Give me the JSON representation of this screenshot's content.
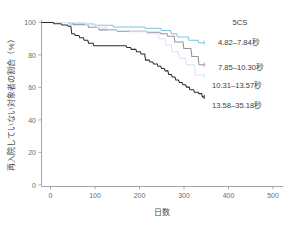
{
  "chart_data": {
    "type": "line",
    "title": "",
    "subtitle": "",
    "xlabel": "日数",
    "ylabel": "再入院していない対象者の割合（%）",
    "xlim": [
      -20,
      540
    ],
    "ylim": [
      0,
      104
    ],
    "xticks": [
      0,
      100,
      200,
      300,
      400,
      500
    ],
    "yticks": [
      0,
      20,
      40,
      60,
      80,
      100
    ],
    "xtick_labels": [
      "0",
      "100",
      "200",
      "300",
      "400",
      "500"
    ],
    "ytick_labels": [
      "0",
      "20",
      "40",
      "60",
      "80",
      "100"
    ],
    "grid": false,
    "legend_position": "right-inside",
    "legend_title": "5CS",
    "series": [
      {
        "name": "4.82-7.84秒",
        "label": "4.82–7.84秒",
        "color": "#7fc4e0",
        "x": [
          0,
          60,
          62,
          118,
          120,
          160,
          162,
          232,
          234,
          268,
          270,
          290,
          292,
          304,
          306,
          330,
          332,
          352,
          354,
          366
        ],
        "y": [
          100,
          100,
          99,
          99,
          98.2,
          98.2,
          97.2,
          97.2,
          96.4,
          96.4,
          95,
          95,
          93,
          93,
          91,
          91,
          89,
          89,
          87.5,
          87.5
        ],
        "final_value": 87.5
      },
      {
        "name": "7.85-10.30秒",
        "label": "7.85–10.30秒",
        "color": "#9a8fa0",
        "x": [
          0,
          70,
          72,
          104,
          106,
          128,
          130,
          168,
          170,
          236,
          238,
          266,
          268,
          282,
          284,
          298,
          300,
          318,
          320,
          336,
          338,
          352,
          354,
          366
        ],
        "y": [
          100,
          100,
          98.6,
          98.6,
          97,
          97,
          95.4,
          95.4,
          94.6,
          94.6,
          94,
          94,
          93,
          93,
          91.5,
          91.5,
          88,
          88,
          84,
          84,
          79,
          79,
          74,
          74
        ],
        "final_value": 74
      },
      {
        "name": "10.31-13.57秒",
        "label": "10.31–13.57秒",
        "color": "#d3e8f2",
        "x": [
          0,
          98,
          100,
          124,
          126,
          148,
          150,
          198,
          200,
          236,
          238,
          262,
          264,
          278,
          280,
          292,
          294,
          308,
          310,
          324,
          326,
          344,
          346,
          366
        ],
        "y": [
          100,
          100,
          98.6,
          98.6,
          96.8,
          96.8,
          95.2,
          95.2,
          94.2,
          94.2,
          93,
          93,
          90,
          90,
          86,
          86,
          82,
          82,
          78,
          78,
          74,
          74,
          67.5,
          67.5
        ],
        "final_value": 67.5
      },
      {
        "name": "13.58-35.18秒",
        "label": "13.58–35.18秒",
        "color": "#2b2b2b",
        "x": [
          0,
          26,
          28,
          44,
          46,
          58,
          60,
          66,
          68,
          74,
          76,
          84,
          86,
          94,
          96,
          104,
          106,
          116,
          118,
          190,
          192,
          200,
          202,
          212,
          214,
          222,
          224,
          232,
          234,
          242,
          244,
          250,
          252,
          260,
          262,
          268,
          270,
          276,
          278,
          284,
          286,
          292,
          294,
          300,
          302,
          308,
          310,
          316,
          318,
          324,
          326,
          332,
          334,
          342,
          344,
          352,
          354,
          360,
          362,
          366
        ],
        "y": [
          100,
          100,
          99.2,
          99.2,
          98.4,
          98.4,
          97.6,
          97.6,
          93,
          93,
          92,
          92,
          90.6,
          90.6,
          89,
          89,
          87.2,
          87.2,
          85.6,
          85.6,
          84.6,
          84.6,
          83.4,
          83.4,
          82,
          82,
          80.6,
          80.6,
          76.8,
          76.8,
          75.6,
          75.6,
          74.4,
          74.4,
          73,
          73,
          71.6,
          71.6,
          70.2,
          70.2,
          68,
          68,
          66.4,
          66.4,
          64.6,
          64.6,
          63,
          63,
          61.6,
          61.6,
          60.2,
          60.2,
          58.6,
          58.6,
          57,
          57,
          56.2,
          56.2,
          54.2,
          54.2
        ],
        "final_value": 54.2
      }
    ]
  },
  "legend": {
    "title": "5CS",
    "items": [
      {
        "label": "4.82–7.84秒",
        "color": "#7fc4e0"
      },
      {
        "label": "7.85–10.30秒",
        "color": "#9a8fa0"
      },
      {
        "label": "10.31–13.57秒",
        "color": "#d3e8f2"
      },
      {
        "label": "13.58–35.18秒",
        "color": "#2b2b2b"
      }
    ]
  },
  "axes": {
    "x_title": "日数",
    "y_title": "再入院していない対象者の割合（%）",
    "x_ticks": [
      "0",
      "100",
      "200",
      "300",
      "400",
      "500"
    ],
    "y_ticks": [
      "0",
      "20",
      "40",
      "60",
      "80",
      "100"
    ]
  },
  "colors": {
    "axis": "#9a9a9a",
    "text": "#4a4a4a",
    "background": "#ffffff"
  }
}
